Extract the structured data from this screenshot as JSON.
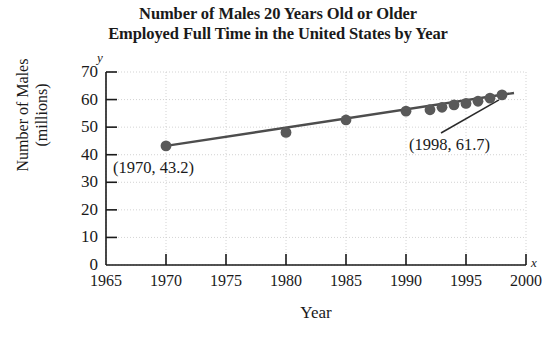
{
  "chart_data": {
    "type": "scatter",
    "title": "Number of Males 20 Years Old or Older Employed Full Time in the United States by Year",
    "title_line1": "Number of Males 20 Years Old or Older",
    "title_line2": "Employed Full Time in the United States by Year",
    "xlabel": "Year",
    "ylabel": "Number of Males (millions)",
    "ylabel_line1": "Number of Males",
    "ylabel_line2": "(millions)",
    "x_axis_letter": "x",
    "y_axis_letter": "y",
    "xlim": [
      1965,
      2000
    ],
    "ylim": [
      0,
      70
    ],
    "x_ticks": [
      1965,
      1970,
      1975,
      1980,
      1985,
      1990,
      1995,
      2000
    ],
    "x_tick_labels": [
      "1965",
      "1970",
      "1975",
      "1980",
      "1985",
      "1990",
      "1995",
      "2000"
    ],
    "y_ticks": [
      0,
      10,
      20,
      30,
      40,
      50,
      60,
      70
    ],
    "y_tick_labels": [
      "0",
      "10",
      "20",
      "30",
      "40",
      "50",
      "60",
      "70"
    ],
    "grid": true,
    "legend": false,
    "x": [
      1970,
      1980,
      1985,
      1990,
      1992,
      1993,
      1994,
      1995,
      1996,
      1997,
      1998
    ],
    "values": [
      43.2,
      48.1,
      52.6,
      55.8,
      56.3,
      57.2,
      58.1,
      58.6,
      59.4,
      60.5,
      61.7
    ],
    "points": [
      {
        "x": 1970,
        "y": 43.2
      },
      {
        "x": 1980,
        "y": 48.1
      },
      {
        "x": 1985,
        "y": 52.6
      },
      {
        "x": 1990,
        "y": 55.8
      },
      {
        "x": 1992,
        "y": 56.3
      },
      {
        "x": 1993,
        "y": 57.2
      },
      {
        "x": 1994,
        "y": 58.1
      },
      {
        "x": 1995,
        "y": 58.6
      },
      {
        "x": 1996,
        "y": 59.4
      },
      {
        "x": 1997,
        "y": 60.5
      },
      {
        "x": 1998,
        "y": 61.7
      }
    ],
    "trend_line": {
      "from": {
        "x": 1970,
        "y": 43.2
      },
      "to": {
        "x": 1999,
        "y": 62.4
      }
    },
    "annotations": [
      {
        "text": "(1970, 43.2)",
        "target": {
          "x": 1970,
          "y": 43.2
        },
        "leader": false
      },
      {
        "text": "(1998, 61.7)",
        "target": {
          "x": 1998,
          "y": 61.7
        },
        "leader": true
      }
    ],
    "point_color": "#595959",
    "line_color": "#4d4d4d",
    "grid_color": "#c8c8c8",
    "axis_color": "#1a1a1a"
  }
}
